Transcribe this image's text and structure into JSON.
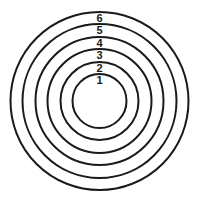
{
  "diagram": {
    "type": "concentric-circles",
    "center": {
      "x": 99.5,
      "y": 101
    },
    "rings": [
      {
        "label": "1",
        "radius": 27
      },
      {
        "label": "2",
        "radius": 39
      },
      {
        "label": "3",
        "radius": 52
      },
      {
        "label": "4",
        "radius": 64
      },
      {
        "label": "5",
        "radius": 77
      },
      {
        "label": "6",
        "radius": 89
      }
    ],
    "stroke_color": "#1a1a1a",
    "background": "#ffffff"
  }
}
